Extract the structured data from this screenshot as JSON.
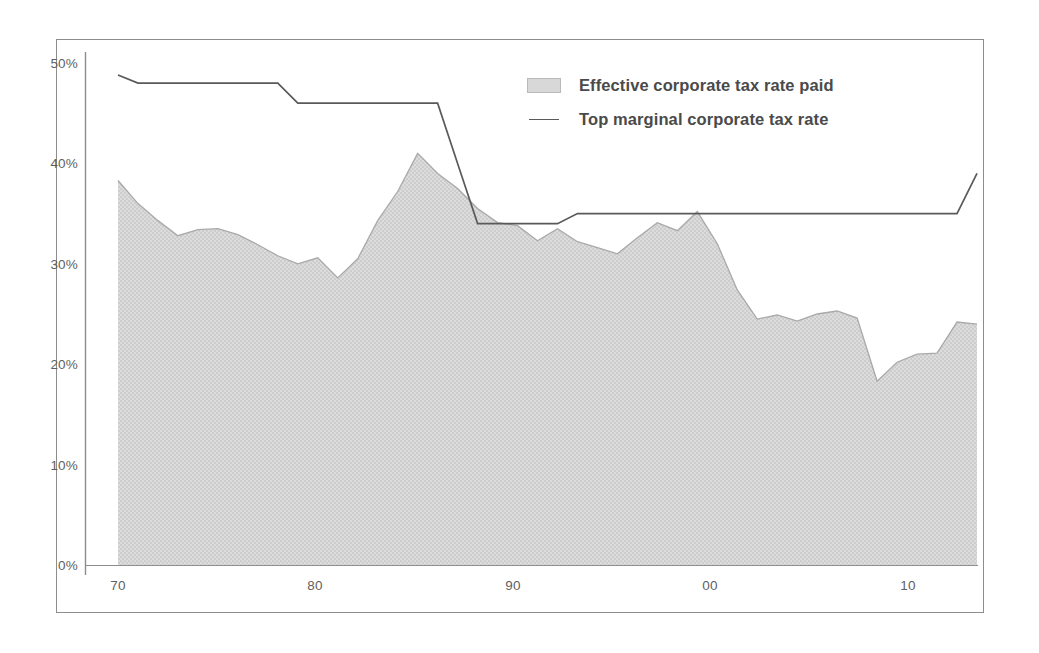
{
  "chart_data": {
    "type": "area",
    "title": "",
    "subtitle": "",
    "xlabel": "",
    "ylabel": "",
    "xlim": [
      1970,
      2013
    ],
    "ylim": [
      0,
      50
    ],
    "y_unit": "%",
    "grid": false,
    "legend_position": "top-right",
    "y_ticks": [
      "0%",
      "10%",
      "20%",
      "30%",
      "40%",
      "50%"
    ],
    "y_tick_values": [
      0,
      10,
      20,
      30,
      40,
      50
    ],
    "x_ticks": [
      "70",
      "80",
      "90",
      "00",
      "10"
    ],
    "x_tick_values": [
      1970,
      1980,
      1990,
      2000,
      2010
    ],
    "x": [
      1970,
      1971,
      1972,
      1973,
      1974,
      1975,
      1976,
      1977,
      1978,
      1979,
      1980,
      1981,
      1982,
      1983,
      1984,
      1985,
      1986,
      1987,
      1988,
      1989,
      1990,
      1991,
      1992,
      1993,
      1994,
      1995,
      1996,
      1997,
      1998,
      1999,
      2000,
      2001,
      2002,
      2003,
      2004,
      2005,
      2006,
      2007,
      2008,
      2009,
      2010,
      2011,
      2012,
      2013
    ],
    "series": [
      {
        "name": "Effective corporate tax rate paid",
        "kind": "area",
        "color": "#d5d5d5",
        "line_color": "#a9a9a9",
        "values": [
          38.3,
          36.0,
          34.3,
          32.8,
          33.4,
          33.5,
          32.9,
          31.9,
          30.8,
          30.0,
          30.6,
          28.6,
          30.5,
          34.3,
          37.2,
          41.0,
          39.0,
          37.5,
          35.5,
          34.1,
          33.8,
          32.3,
          33.5,
          32.2,
          31.6,
          31.0,
          32.6,
          34.1,
          33.3,
          35.2,
          32.0,
          27.4,
          24.5,
          24.9,
          24.3,
          25.0,
          25.3,
          24.6,
          18.3,
          20.2,
          21.0,
          21.1,
          24.2,
          24.0
        ]
      },
      {
        "name": "Top marginal corporate tax rate",
        "kind": "line",
        "color": "#5a5a5a",
        "values": [
          48.8,
          48.0,
          48.0,
          48.0,
          48.0,
          48.0,
          48.0,
          48.0,
          48.0,
          46.0,
          46.0,
          46.0,
          46.0,
          46.0,
          46.0,
          46.0,
          46.0,
          40.0,
          34.0,
          34.0,
          34.0,
          34.0,
          34.0,
          35.0,
          35.0,
          35.0,
          35.0,
          35.0,
          35.0,
          35.0,
          35.0,
          35.0,
          35.0,
          35.0,
          35.0,
          35.0,
          35.0,
          35.0,
          35.0,
          35.0,
          35.0,
          35.0,
          35.0,
          39.0
        ]
      }
    ]
  },
  "legend": {
    "items": [
      {
        "label": "Effective corporate tax rate paid",
        "marker": "area-swatch"
      },
      {
        "label": "Top marginal corporate tax rate",
        "marker": "line-swatch"
      }
    ]
  },
  "colors": {
    "area_fill": "#d5d5d5",
    "area_stroke": "#a9a9a9",
    "line": "#5a5a5a",
    "frame": "#8d8d8d",
    "axis": "#8d8d8d",
    "tick_text": "#5f5f5f",
    "legend_text": "#4a4a4a",
    "background": "#ffffff"
  }
}
